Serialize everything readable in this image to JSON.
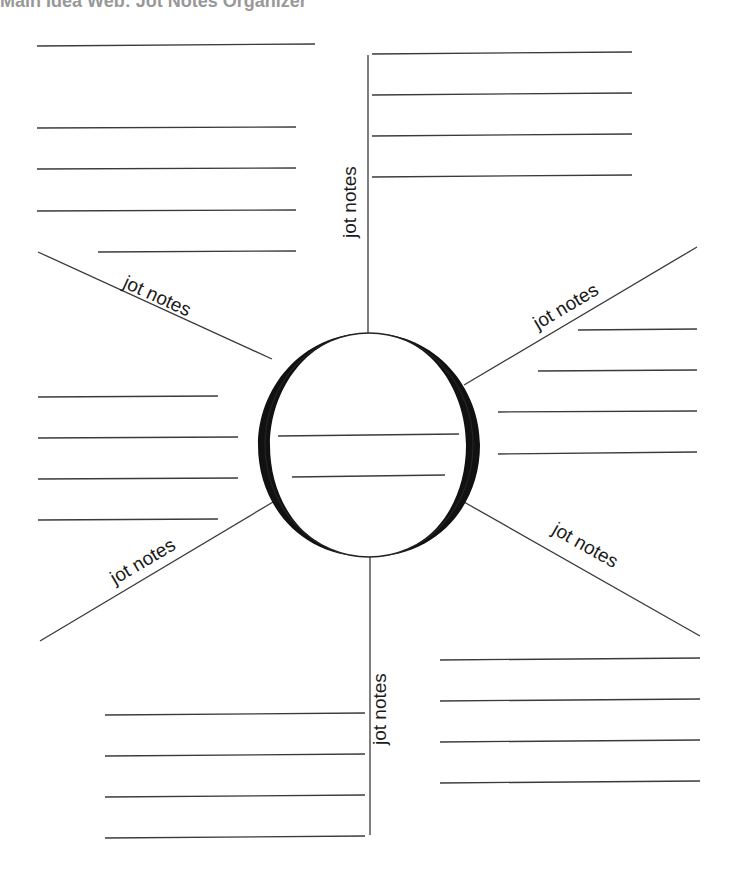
{
  "title": "Main Idea Web: Jot Notes Organizer",
  "labels": {
    "top": "jot notes",
    "upper_left": "jot notes",
    "upper_right": "jot notes",
    "lower_left": "jot notes",
    "lower_right": "jot notes",
    "bottom": "jot notes"
  },
  "colors": {
    "line": "#3a3a3a",
    "circle_stroke": "#111111",
    "background": "#ffffff"
  }
}
